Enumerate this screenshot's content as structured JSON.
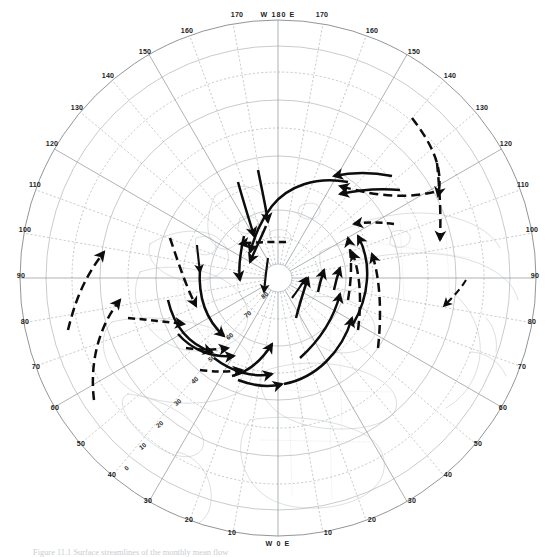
{
  "figure": {
    "domain": "Map",
    "type": "polar-stereographic-map",
    "projection": "Northern Hemisphere polar stereographic",
    "caption": "Figure 11.1  Surface streamlines of the monthly mean flow"
  },
  "poles": {
    "top_label": "W 180 E",
    "bottom_label": "W 0 E"
  },
  "longitude_labels": {
    "top_left": [
      "170",
      "160",
      "150",
      "140",
      "130",
      "120",
      "110",
      "100",
      "90"
    ],
    "top_right": [
      "170",
      "160",
      "150",
      "140",
      "130",
      "120",
      "110",
      "100",
      "90"
    ],
    "bottom_left": [
      "80",
      "70",
      "60",
      "50",
      "40",
      "30",
      "20",
      "10"
    ],
    "bottom_right": [
      "80",
      "70",
      "60",
      "50",
      "40",
      "30",
      "20",
      "10"
    ]
  },
  "ring_labels": [
    {
      "text": "170",
      "x": 237,
      "y": 17
    },
    {
      "text": "170",
      "x": 322,
      "y": 17
    },
    {
      "text": "160",
      "x": 187,
      "y": 33
    },
    {
      "text": "160",
      "x": 372,
      "y": 33
    },
    {
      "text": "150",
      "x": 145,
      "y": 54
    },
    {
      "text": "150",
      "x": 414,
      "y": 54
    },
    {
      "text": "140",
      "x": 108,
      "y": 78
    },
    {
      "text": "140",
      "x": 450,
      "y": 78
    },
    {
      "text": "130",
      "x": 77,
      "y": 110
    },
    {
      "text": "130",
      "x": 482,
      "y": 110
    },
    {
      "text": "120",
      "x": 52,
      "y": 146
    },
    {
      "text": "120",
      "x": 506,
      "y": 146
    },
    {
      "text": "110",
      "x": 35,
      "y": 187
    },
    {
      "text": "110",
      "x": 523,
      "y": 187
    },
    {
      "text": "100",
      "x": 25,
      "y": 232
    },
    {
      "text": "100",
      "x": 532,
      "y": 232
    },
    {
      "text": "90",
      "x": 21,
      "y": 278
    },
    {
      "text": "90",
      "x": 535,
      "y": 278
    },
    {
      "text": "80",
      "x": 25,
      "y": 324
    },
    {
      "text": "80",
      "x": 532,
      "y": 324
    },
    {
      "text": "70",
      "x": 36,
      "y": 369
    },
    {
      "text": "70",
      "x": 522,
      "y": 369
    },
    {
      "text": "60",
      "x": 55,
      "y": 410
    },
    {
      "text": "60",
      "x": 503,
      "y": 410
    },
    {
      "text": "50",
      "x": 81,
      "y": 446
    },
    {
      "text": "50",
      "x": 478,
      "y": 446
    },
    {
      "text": "40",
      "x": 112,
      "y": 477
    },
    {
      "text": "40",
      "x": 448,
      "y": 477
    },
    {
      "text": "30",
      "x": 148,
      "y": 503
    },
    {
      "text": "30",
      "x": 412,
      "y": 503
    },
    {
      "text": "20",
      "x": 189,
      "y": 522
    },
    {
      "text": "20",
      "x": 372,
      "y": 522
    },
    {
      "text": "10",
      "x": 232,
      "y": 535
    },
    {
      "text": "10",
      "x": 328,
      "y": 535
    }
  ],
  "latitude_labels": [
    {
      "text": "80",
      "x": 266,
      "y": 297,
      "rot": -38
    },
    {
      "text": "70",
      "x": 249,
      "y": 316,
      "rot": -38
    },
    {
      "text": "60",
      "x": 231,
      "y": 338,
      "rot": -38
    },
    {
      "text": "50",
      "x": 213,
      "y": 360,
      "rot": -38
    },
    {
      "text": "40",
      "x": 196,
      "y": 382,
      "rot": -38
    },
    {
      "text": "30",
      "x": 179,
      "y": 404,
      "rot": -38
    },
    {
      "text": "20",
      "x": 161,
      "y": 426,
      "rot": -38
    },
    {
      "text": "10",
      "x": 144,
      "y": 448,
      "rot": -38
    },
    {
      "text": "0",
      "x": 128,
      "y": 470,
      "rot": -38
    }
  ],
  "streamlines": {
    "description": "Dashed and solid black streamline arrows showing cyclonic (counter-clockwise) circulation centred near the pole, with outer inflow/outflow arrows.",
    "count": 24,
    "style": {
      "color": "#0d0d0d",
      "stroke_width": 2.5,
      "dash_pattern": "9 5"
    }
  },
  "colors": {
    "background": "#ffffff",
    "graticule": "#9aa0a6",
    "coastline": "#b2b7ba",
    "streamline": "#0d0d0d",
    "label": "#1c1c1c"
  }
}
